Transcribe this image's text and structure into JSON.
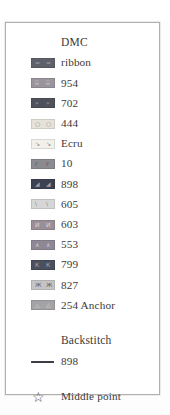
{
  "panel": {
    "border_color": "#b0b0ae",
    "background": "#ffffff"
  },
  "legend": {
    "header": "DMC",
    "entries": [
      {
        "label": "ribbon",
        "color": "#5e616a",
        "symbol": "=",
        "symbol_color": "#9ea2ab",
        "symbol_name": "equals-symbol"
      },
      {
        "label": "954",
        "color": "#9a949c",
        "symbol": "⌸",
        "symbol_color": "#d9d5dc",
        "symbol_name": "grid-symbol"
      },
      {
        "label": "702",
        "color": "#4f525c",
        "symbol": "»",
        "symbol_color": "#a7abb5",
        "symbol_name": "double-chevron-symbol"
      },
      {
        "label": "444",
        "color": "#e6e2da",
        "symbol": "○",
        "symbol_color": "#8e8a84",
        "symbol_name": "circle-symbol"
      },
      {
        "label": "Ecru",
        "color": "#f2f0eb",
        "symbol": "↘",
        "symbol_color": "#7d7a75",
        "symbol_name": "diagonal-arrow-symbol"
      },
      {
        "label": "10",
        "color": "#8a8a90",
        "symbol": "г",
        "symbol_color": "#50505a",
        "symbol_name": "gamma-symbol"
      },
      {
        "label": "898",
        "color": "#3e4250",
        "symbol": "◢",
        "symbol_color": "#9aa0b0",
        "symbol_name": "corner-triangle-symbol"
      },
      {
        "label": "605",
        "color": "#d6d6d6",
        "symbol": "\\",
        "symbol_color": "#85858a",
        "symbol_name": "backslash-symbol"
      },
      {
        "label": "603",
        "color": "#9a8f96",
        "symbol": "И",
        "symbol_color": "#ded8dc",
        "symbol_name": "cyrillic-i-symbol"
      },
      {
        "label": "553",
        "color": "#8e8894",
        "symbol": "∧",
        "symbol_color": "#d8d4dc",
        "symbol_name": "caret-symbol"
      },
      {
        "label": "799",
        "color": "#4b505e",
        "symbol": "К",
        "symbol_color": "#a6aab6",
        "symbol_name": "cyrillic-k-symbol"
      },
      {
        "label": "827",
        "color": "#c4c4c6",
        "symbol": "Ж",
        "symbol_color": "#5c5c62",
        "symbol_name": "cyrillic-zhe-symbol"
      },
      {
        "label": "254 Anchor",
        "color": "#a3a3a5",
        "symbol": "△",
        "symbol_color": "#dedede",
        "symbol_name": "triangle-symbol"
      }
    ]
  },
  "backstitch": {
    "header": "Backstitch",
    "line_color": "#3d3d44",
    "entries": [
      {
        "label": "898"
      }
    ]
  },
  "middle_point": {
    "icon": "☆",
    "icon_name": "star-outline-icon",
    "label": "Middle point"
  }
}
